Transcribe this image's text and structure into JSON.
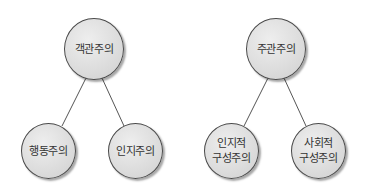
{
  "trees": [
    {
      "root": {
        "label": "객관주의"
      },
      "children": [
        {
          "label": "행동주의"
        },
        {
          "label": "인지주의"
        }
      ]
    },
    {
      "root": {
        "label": "주관주의"
      },
      "children": [
        {
          "label": "인지적\n구성주의"
        },
        {
          "label": "사회적\n구성주의"
        }
      ]
    }
  ],
  "colors": {
    "node_fill": "#dcdcdc",
    "node_border": "#4a4a4a",
    "line": "#555555",
    "text": "#333333"
  }
}
